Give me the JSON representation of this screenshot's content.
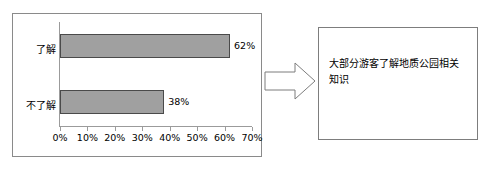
{
  "chart_data": {
    "type": "bar",
    "orientation": "horizontal",
    "title": "",
    "xlabel": "",
    "ylabel": "",
    "categories": [
      "了解",
      "不了解"
    ],
    "values": [
      62,
      38
    ],
    "value_labels": [
      "62%",
      "38%"
    ],
    "xlim": [
      0,
      70
    ],
    "x_tick_labels": [
      "0%",
      "10%",
      "20%",
      "30%",
      "40%",
      "50%",
      "60%",
      "70%"
    ],
    "x_tick_values": [
      0,
      10,
      20,
      30,
      40,
      50,
      60,
      70
    ],
    "grid": false,
    "legend": false,
    "bar_fill_color": "#a0a0a0",
    "bar_border_color": "#4a4a4a",
    "axis_color": "#9b9b9b",
    "panel_border_color": "#8a8a8a"
  },
  "flow": {
    "arrow_icon": "right-block-arrow",
    "arrow_color": "#7d7d7d"
  },
  "conclusion": {
    "text": "大部分游客了解地质公园相关知识",
    "border_color": "#7d7d7d"
  }
}
